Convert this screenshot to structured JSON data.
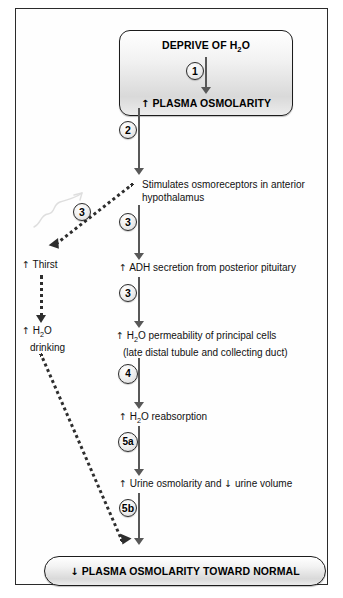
{
  "diagram": {
    "top_box": {
      "line1": "DEPRIVE OF H",
      "line1_sub": "2",
      "line1_end": "O",
      "line2_arrow": "↑",
      "line2": " PLASMA OSMOLARITY"
    },
    "bottom_box": {
      "arrow": "↓",
      "text": " PLASMA OSMOLARITY TOWARD NORMAL"
    },
    "nodes": [
      {
        "id": "osmoreceptors",
        "line1": "Stimulates osmoreceptors in anterior",
        "line2": "hypothalamus"
      },
      {
        "id": "adh",
        "arrow": "↑",
        "text": " ADH secretion from posterior pituitary"
      },
      {
        "id": "permeability",
        "arrow": "↑",
        "line1_a": " H",
        "line1_sub": "2",
        "line1_b": "O permeability of principal cells",
        "line2": "(late distal tubule and collecting duct)"
      },
      {
        "id": "reabsorption",
        "arrow": "↑",
        "text_a": " H",
        "sub": "2",
        "text_b": "O reabsorption"
      },
      {
        "id": "urine",
        "arrow_up": "↑",
        "text_a": " Urine osmolarity and  ",
        "arrow_down": "↓",
        "text_b": " urine volume"
      },
      {
        "id": "thirst",
        "arrow": "↑",
        "text": " Thirst"
      },
      {
        "id": "drinking",
        "arrow": "↑",
        "line1_a": " H",
        "line1_sub": "2",
        "line1_b": "O",
        "line2": "drinking"
      }
    ],
    "steps": [
      {
        "id": "step-1",
        "label": "1"
      },
      {
        "id": "step-2",
        "label": "2"
      },
      {
        "id": "step-3-main",
        "label": "3"
      },
      {
        "id": "step-3-thirst",
        "label": "3"
      },
      {
        "id": "step-4",
        "label": "4"
      },
      {
        "id": "step-5a",
        "label": "5a"
      },
      {
        "id": "step-5b",
        "label": "5b"
      },
      {
        "id": "step-6",
        "label": "6"
      }
    ],
    "colors": {
      "frame": "#2b2b2b",
      "arrow": "#585858",
      "dotted_arrow": "#2e2e2e",
      "box_border": "#1c1c1c",
      "text": "#111111"
    }
  }
}
